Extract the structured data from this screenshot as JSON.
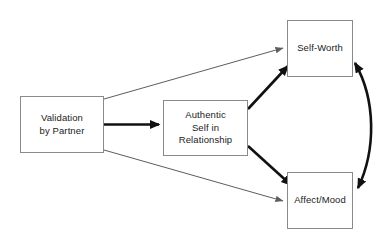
{
  "diagram": {
    "background_color": "#ffffff",
    "line_color_thin": "#5d5d5d",
    "line_color_thick": "#111111",
    "box_border_color": "#8a8a8a",
    "text_color": "#1b1b1b",
    "nodes": [
      {
        "id": "validation",
        "label": "Validation\nby Partner",
        "x": 20,
        "y": 96,
        "w": 84,
        "h": 57
      },
      {
        "id": "authentic",
        "label": "Authentic\nSelf in\nRelationship",
        "x": 163,
        "y": 100,
        "w": 85,
        "h": 56
      },
      {
        "id": "selfworth",
        "label": "Self-Worth",
        "x": 287,
        "y": 20,
        "w": 66,
        "h": 57
      },
      {
        "id": "affectmood",
        "label": "Affect/Mood",
        "x": 287,
        "y": 172,
        "w": 66,
        "h": 57
      }
    ],
    "edges": [
      {
        "id": "validation-to-selfworth",
        "from": "validation",
        "to": "selfworth",
        "weight": "thin",
        "arrowheads": "single"
      },
      {
        "id": "validation-to-authentic",
        "from": "validation",
        "to": "authentic",
        "weight": "thick",
        "arrowheads": "single"
      },
      {
        "id": "validation-to-affectmood",
        "from": "validation",
        "to": "affectmood",
        "weight": "thin",
        "arrowheads": "single"
      },
      {
        "id": "authentic-to-selfworth",
        "from": "authentic",
        "to": "selfworth",
        "weight": "thick",
        "arrowheads": "single"
      },
      {
        "id": "authentic-to-affectmood",
        "from": "authentic",
        "to": "affectmood",
        "weight": "thick",
        "arrowheads": "single"
      },
      {
        "id": "selfworth-affectmood-correlation",
        "from": "selfworth",
        "to": "affectmood",
        "weight": "thick",
        "arrowheads": "double",
        "shape": "curved"
      }
    ]
  }
}
